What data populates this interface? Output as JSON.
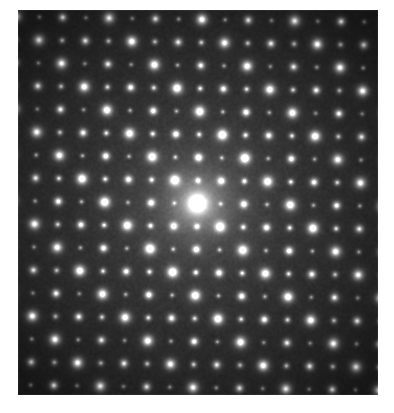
{
  "figure": {
    "kind": "electron-diffraction-pattern",
    "caption": "",
    "width_px": 394,
    "height_px": 413,
    "background_color": "#ffffff"
  },
  "plate": {
    "left_px": 18,
    "top_px": 10,
    "width_px": 360,
    "height_px": 385,
    "background_color": "#0a0a0a",
    "center_x_px": 179,
    "center_y_px": 193
  },
  "chart_data": {
    "type": "scatter",
    "title": "",
    "subtitle": "",
    "xlabel": "",
    "ylabel": "",
    "grid": false,
    "legend_position": "none",
    "description": "Selected-area electron diffraction pattern: a near-square reciprocal lattice of sharp Bragg reflections with a very bright central direct beam, a brighter super-lattice sub-set of spots, and weaker superstructure reflections at interstitial positions. Overall intensity falls off radially from the centre toward the dark corners.",
    "xlim": [
      0,
      360
    ],
    "ylim": [
      0,
      385
    ],
    "lattice": {
      "a1_x": 23.2,
      "a1_y": 0.35,
      "a2_x": -0.55,
      "a2_y": 23.0,
      "origin_x": 179,
      "origin_y": 193,
      "i_range": [
        -9,
        9
      ],
      "j_range": [
        -9,
        9
      ]
    },
    "spot_classes": [
      {
        "name": "direct-beam",
        "rule": "i==0 && j==0",
        "radius_px": 10.5,
        "peak_intensity": 1.0,
        "halo_px": 26
      },
      {
        "name": "super-bright",
        "rule": "(i+j) even && (i-j) % 4 == 0",
        "radius_px": 5.6,
        "peak_intensity": 0.95,
        "halo_px": 11
      },
      {
        "name": "strong",
        "rule": "(i+j) even",
        "radius_px": 4.4,
        "peak_intensity": 0.8,
        "halo_px": 8
      },
      {
        "name": "medium",
        "rule": "(i+j) odd && (i % 2) == 0",
        "radius_px": 3.4,
        "peak_intensity": 0.58,
        "halo_px": 6
      },
      {
        "name": "weak",
        "rule": "(i+j) odd",
        "radius_px": 2.9,
        "peak_intensity": 0.42,
        "halo_px": 5
      }
    ],
    "background": {
      "center_gray": 62,
      "edge_gray": 18,
      "falloff_radius_px": 265,
      "noise_amplitude": 13
    },
    "intensity_falloff": {
      "model": "gaussian-plus-linear",
      "sigma_px": 170,
      "floor": 0.18
    },
    "measured_spots_sample": [
      {
        "label": "000",
        "x_px": 179,
        "y_px": 193,
        "relative_intensity": 1.0,
        "class": "direct-beam"
      },
      {
        "label": "400",
        "x_px": 272,
        "y_px": 195,
        "relative_intensity": 0.92,
        "class": "super-bright"
      },
      {
        "label": "-400",
        "x_px": 86,
        "y_px": 192,
        "relative_intensity": 0.9,
        "class": "super-bright"
      },
      {
        "label": "040",
        "x_px": 177,
        "y_px": 285,
        "relative_intensity": 0.9,
        "class": "super-bright"
      },
      {
        "label": "0-40",
        "x_px": 181,
        "y_px": 101,
        "relative_intensity": 0.91,
        "class": "super-bright"
      },
      {
        "label": "220",
        "x_px": 225,
        "y_px": 216,
        "relative_intensity": 0.8,
        "class": "strong"
      },
      {
        "label": "-220",
        "x_px": 133,
        "y_px": 216,
        "relative_intensity": 0.79,
        "class": "strong"
      },
      {
        "label": "2-20",
        "x_px": 226,
        "y_px": 170,
        "relative_intensity": 0.8,
        "class": "strong"
      },
      {
        "label": "-2-20",
        "x_px": 132,
        "y_px": 170,
        "relative_intensity": 0.79,
        "class": "strong"
      },
      {
        "label": "110",
        "x_px": 202,
        "y_px": 204,
        "relative_intensity": 0.55,
        "class": "medium"
      },
      {
        "label": "200",
        "x_px": 225,
        "y_px": 194,
        "relative_intensity": 0.6,
        "class": "medium"
      },
      {
        "label": "020",
        "x_px": 178,
        "y_px": 239,
        "relative_intensity": 0.6,
        "class": "medium"
      }
    ]
  },
  "annotations": {
    "scale_bar_text": "",
    "zone_axis_text": "",
    "any_visible_text": false
  }
}
